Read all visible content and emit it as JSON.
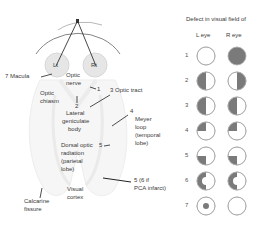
{
  "pathway": {
    "eyes": {
      "left": "Lt",
      "right": "Rt"
    },
    "labels": {
      "macula": "7 Macula",
      "optic_nerve_1": "Optic",
      "optic_nerve_2": "nerve",
      "optic_chiasm_1": "Optic",
      "optic_chiasm_2": "chiasm",
      "num_1": "1",
      "optic_tract": "3  Optic tract",
      "num_2": "2",
      "lgb_1": "Lateral",
      "lgb_2": "geniculate",
      "lgb_3": "body",
      "num_4": "4",
      "meyer_1": "Meyer",
      "meyer_2": "loop",
      "meyer_3": "(temporal",
      "meyer_4": "lobe)",
      "dorsal_1": "Dorsal optic",
      "dorsal_2": "radiation",
      "dorsal_3": "(parietal",
      "dorsal_4": "lobe)",
      "num_5": "5",
      "pca_1": "5 (6 if",
      "pca_2": "PCA infarct)",
      "visual_cortex_1": "Visual",
      "visual_cortex_2": "cortex",
      "calcarine_1": "Calcarine",
      "calcarine_2": "fissure"
    }
  },
  "defects": {
    "title": "Defect in visual field of",
    "col_left": "L eye",
    "col_right": "R eye",
    "fill_color": "#7a7a7a",
    "rows": [
      {
        "num": "1",
        "left": "none",
        "right": "full"
      },
      {
        "num": "2",
        "left": "left-half",
        "right": "right-half"
      },
      {
        "num": "3",
        "left": "left-half",
        "right": "left-half"
      },
      {
        "num": "4",
        "left": "upper-left-quarter",
        "right": "upper-left-quarter"
      },
      {
        "num": "5",
        "left": "lower-left-quarter",
        "right": "lower-left-quarter"
      },
      {
        "num": "6",
        "left": "left-half-macular-sparing",
        "right": "left-half-macular-sparing"
      },
      {
        "num": "7",
        "left": "central-scotoma",
        "right": "none"
      }
    ]
  }
}
